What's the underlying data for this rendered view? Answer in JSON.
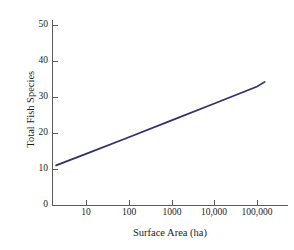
{
  "chart_data": {
    "type": "line",
    "title": "",
    "xlabel": "Surface Area (ha)",
    "ylabel": "Total Fish Species",
    "xscale": "log",
    "yscale": "linear",
    "xlim": [
      2,
      300000
    ],
    "ylim": [
      0,
      52
    ],
    "grid": false,
    "legend": false,
    "legend_position": "none",
    "background_color": "#ffffff",
    "line_color": "#30306a",
    "axis_color": "#5b5b5b",
    "text_color": "#1b1b1b",
    "xticks": [
      10,
      100,
      1000,
      10000,
      100000
    ],
    "xtick_labels": [
      "10",
      "100",
      "1000",
      "10,000",
      "100,000"
    ],
    "yticks": [
      0,
      10,
      20,
      30,
      40,
      50
    ],
    "ytick_labels": [
      "0",
      "10",
      "20",
      "30",
      "40",
      "50"
    ],
    "series": [
      {
        "name": "Fish species richness",
        "x": [
          2,
          150000
        ],
        "y": [
          11,
          34.2
        ],
        "points": [
          {
            "x": 2,
            "y": 11
          },
          {
            "x": 10,
            "y": 14.2
          },
          {
            "x": 100,
            "y": 18.8
          },
          {
            "x": 1000,
            "y": 23.5
          },
          {
            "x": 10000,
            "y": 28.2
          },
          {
            "x": 100000,
            "y": 32.9
          },
          {
            "x": 150000,
            "y": 34.2
          }
        ]
      }
    ]
  },
  "axes": {
    "x_title": "Surface Area (ha)",
    "y_title": "Total Fish Species",
    "x_tick_labels": [
      "10",
      "100",
      "1000",
      "10,000",
      "100,000"
    ],
    "y_tick_labels": [
      "0",
      "10",
      "20",
      "30",
      "40",
      "50"
    ]
  }
}
